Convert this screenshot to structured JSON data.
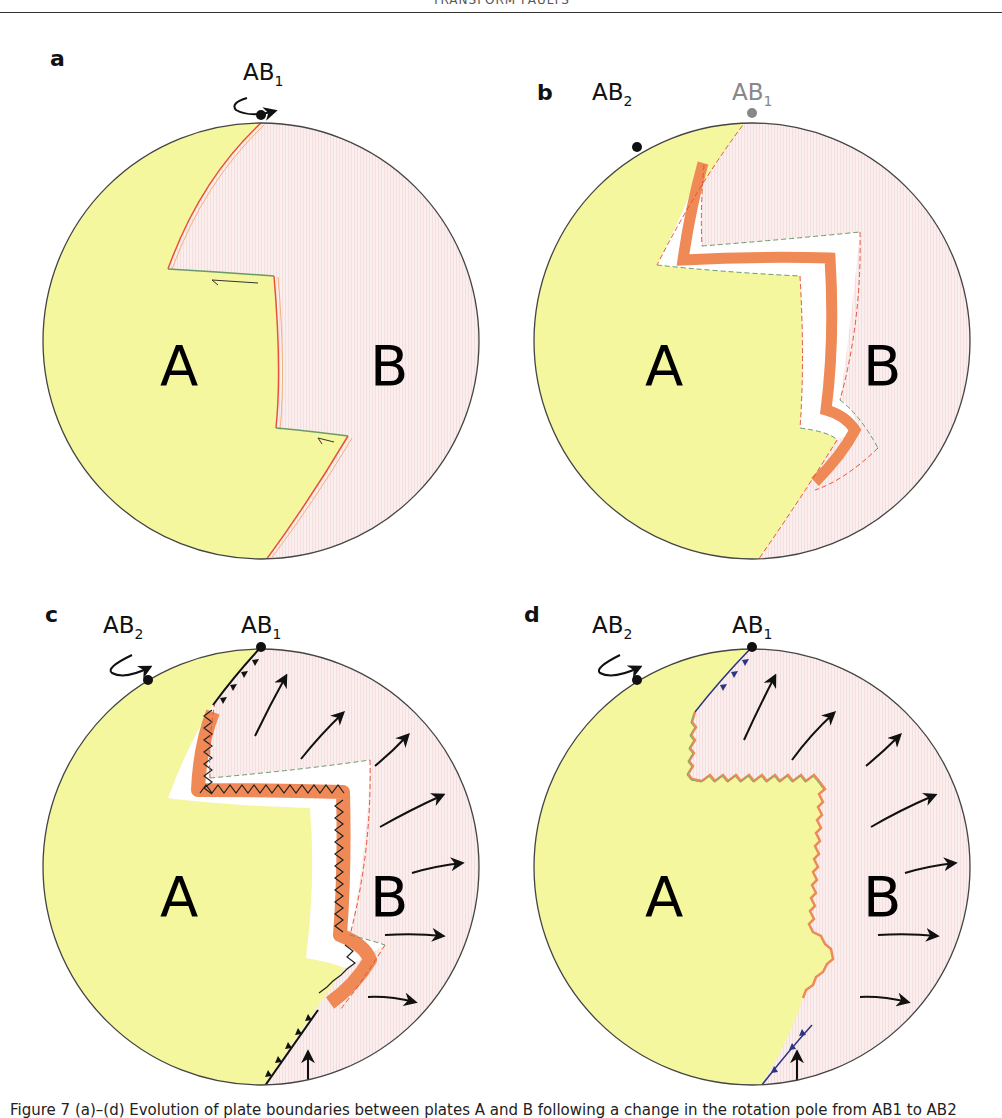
{
  "header": {
    "running_title": "TRANSFORM FAULTS"
  },
  "colors": {
    "plate_a": "#f4f79e",
    "plate_b": "#fbecec",
    "ridge_orange": "#ef8a57",
    "fault_red": "#e8533a",
    "transform_green": "#6a9a6a",
    "subduction_navy": "#2b3580",
    "outline": "#444444"
  },
  "panels": [
    {
      "id": "a",
      "letter": "a",
      "plate_a_label": "A",
      "plate_b_label": "B",
      "poles": [
        {
          "name": "AB",
          "sub": "1",
          "faded": false,
          "rotation_arrow": true
        }
      ]
    },
    {
      "id": "b",
      "letter": "b",
      "plate_a_label": "A",
      "plate_b_label": "B",
      "poles": [
        {
          "name": "AB",
          "sub": "2",
          "faded": false,
          "rotation_arrow": false
        },
        {
          "name": "AB",
          "sub": "1",
          "faded": true,
          "rotation_arrow": false
        }
      ]
    },
    {
      "id": "c",
      "letter": "c",
      "plate_a_label": "A",
      "plate_b_label": "B",
      "poles": [
        {
          "name": "AB",
          "sub": "2",
          "faded": false,
          "rotation_arrow": true
        },
        {
          "name": "AB",
          "sub": "1",
          "faded": false,
          "rotation_arrow": false
        }
      ]
    },
    {
      "id": "d",
      "letter": "d",
      "plate_a_label": "A",
      "plate_b_label": "B",
      "poles": [
        {
          "name": "AB",
          "sub": "2",
          "faded": false,
          "rotation_arrow": true
        },
        {
          "name": "AB",
          "sub": "1",
          "faded": false,
          "rotation_arrow": false
        }
      ]
    }
  ],
  "caption": {
    "text": "Figure 7 (a)–(d) Evolution of plate boundaries between plates A and B following a change in the rotation pole from AB1 to AB2"
  }
}
